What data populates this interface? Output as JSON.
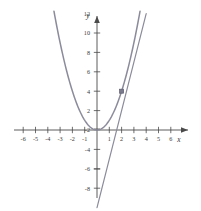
{
  "chart_data": {
    "type": "line",
    "title": "",
    "subtitle": "",
    "xlabel": "x",
    "ylabel": "y",
    "xlim": [
      -6.8,
      6.8
    ],
    "ylim": [
      -8.8,
      12.8
    ],
    "grid": false,
    "legend_position": "none",
    "x_ticks": [
      -6,
      -5,
      -4,
      -3,
      -2,
      -1,
      1,
      2,
      3,
      4,
      5,
      6
    ],
    "x_tick_labels": [
      "-6",
      "-5",
      "-4",
      "-3",
      "-2",
      "-1",
      "1",
      "2",
      "3",
      "4",
      "5",
      "6"
    ],
    "y_ticks": [
      -8,
      -6,
      -4,
      -2,
      2,
      4,
      6,
      8,
      10,
      12
    ],
    "y_tick_labels": [
      "-8",
      "-6",
      "-4",
      "-2",
      "2",
      "4",
      "6",
      "8",
      "10",
      "12"
    ],
    "series": [
      {
        "name": "parabola",
        "equation": "y = x^2",
        "type": "curve",
        "color": "#8b8b9c",
        "x_range": [
          -3.5,
          3.5
        ],
        "points": [
          {
            "x": -3.5,
            "y": 12.25
          },
          {
            "x": -3.0,
            "y": 9.0
          },
          {
            "x": -2.5,
            "y": 6.25
          },
          {
            "x": -2.0,
            "y": 4.0
          },
          {
            "x": -1.5,
            "y": 2.25
          },
          {
            "x": -1.0,
            "y": 1.0
          },
          {
            "x": -0.5,
            "y": 0.25
          },
          {
            "x": 0.0,
            "y": 0.0
          },
          {
            "x": 0.5,
            "y": 0.25
          },
          {
            "x": 1.0,
            "y": 1.0
          },
          {
            "x": 1.5,
            "y": 2.25
          },
          {
            "x": 2.0,
            "y": 4.0
          },
          {
            "x": 2.5,
            "y": 6.25
          },
          {
            "x": 3.0,
            "y": 9.0
          },
          {
            "x": 3.5,
            "y": 12.25
          }
        ]
      },
      {
        "name": "tangent-line",
        "equation": "y = 4x - 4",
        "type": "line",
        "color": "#8b8b9c",
        "x_range": [
          0.0,
          4.0
        ],
        "points": [
          {
            "x": 0.0,
            "y": -8.0
          },
          {
            "x": 1.0,
            "y": -4.0
          },
          {
            "x": 2.0,
            "y": 4.0
          },
          {
            "x": 4.0,
            "y": 12.0
          }
        ],
        "y_intercept": -4,
        "x_intercept": 1
      }
    ],
    "annotations": [
      {
        "name": "tangency-point",
        "marker": "square",
        "x": 2,
        "y": 4,
        "color": "#7b7b8e",
        "label": ""
      }
    ],
    "axis_color": "#4a4a4a",
    "curve_color": "#8b8b9c",
    "background_color": "#ffffff"
  },
  "figure": {
    "x_axis_label": "x",
    "y_axis_label": "y"
  }
}
